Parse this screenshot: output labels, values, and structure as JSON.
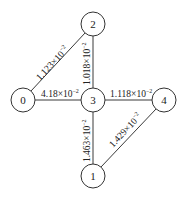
{
  "diagram": {
    "type": "weighted-graph",
    "nodes": [
      {
        "id": "0",
        "label": "0"
      },
      {
        "id": "1",
        "label": "1"
      },
      {
        "id": "2",
        "label": "2"
      },
      {
        "id": "3",
        "label": "3"
      },
      {
        "id": "4",
        "label": "4"
      }
    ],
    "edges": [
      {
        "from": "0",
        "to": "2",
        "mantissa": "1.123",
        "times": "×10",
        "exponent": "−2"
      },
      {
        "from": "2",
        "to": "3",
        "mantissa": "1.018",
        "times": "×10",
        "exponent": "−2"
      },
      {
        "from": "0",
        "to": "3",
        "mantissa": "4.18",
        "times": "×10",
        "exponent": "−2"
      },
      {
        "from": "3",
        "to": "4",
        "mantissa": "1.118",
        "times": "×10",
        "exponent": "−2"
      },
      {
        "from": "3",
        "to": "1",
        "mantissa": "1.463",
        "times": "×10",
        "exponent": "−2"
      },
      {
        "from": "4",
        "to": "1",
        "mantissa": "1.429",
        "times": "×10",
        "exponent": "−2"
      }
    ]
  }
}
